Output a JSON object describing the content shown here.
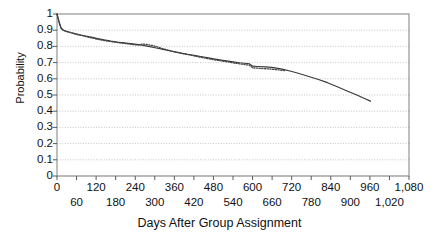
{
  "chart_data": {
    "type": "line",
    "title": "",
    "xlabel": "Days After Group Assignment",
    "ylabel": "Probability",
    "xlim": [
      0,
      1080
    ],
    "ylim": [
      0,
      1
    ],
    "grid": true,
    "legend_position": "none",
    "x_tick_labels": [
      "0",
      "60",
      "120",
      "180",
      "240",
      "300",
      "360",
      "420",
      "480",
      "540",
      "600",
      "660",
      "720",
      "780",
      "840",
      "900",
      "960",
      "1,020",
      "1,080"
    ],
    "x_tick_values": [
      0,
      60,
      120,
      180,
      240,
      300,
      360,
      420,
      480,
      540,
      600,
      660,
      720,
      780,
      840,
      900,
      960,
      1020,
      1080
    ],
    "y_tick_labels": [
      "0",
      "0.1",
      "0.2",
      "0.3",
      "0.4",
      "0.5",
      "0.6",
      "0.7",
      "0.8",
      "0.9",
      "1"
    ],
    "y_tick_values": [
      0,
      0.1,
      0.2,
      0.3,
      0.4,
      0.5,
      0.6,
      0.7,
      0.8,
      0.9,
      1
    ],
    "series": [
      {
        "name": "solid-curve",
        "style": "solid",
        "color": "#3a3a3a",
        "x": [
          0,
          6,
          12,
          20,
          30,
          42,
          55,
          70,
          88,
          105,
          125,
          145,
          165,
          185,
          205,
          225,
          245,
          265,
          285,
          305,
          325,
          345,
          365,
          385,
          405,
          425,
          445,
          465,
          485,
          505,
          525,
          545,
          560,
          575,
          590,
          600,
          615,
          640,
          665,
          690,
          715,
          740,
          770,
          800,
          830,
          860,
          890,
          920,
          945,
          962
        ],
        "y": [
          1.0,
          0.955,
          0.915,
          0.9,
          0.893,
          0.886,
          0.879,
          0.872,
          0.864,
          0.857,
          0.848,
          0.84,
          0.833,
          0.827,
          0.822,
          0.817,
          0.812,
          0.806,
          0.799,
          0.79,
          0.782,
          0.773,
          0.765,
          0.757,
          0.75,
          0.743,
          0.736,
          0.729,
          0.722,
          0.715,
          0.709,
          0.703,
          0.699,
          0.696,
          0.693,
          0.678,
          0.676,
          0.673,
          0.669,
          0.66,
          0.648,
          0.634,
          0.616,
          0.597,
          0.576,
          0.551,
          0.525,
          0.5,
          0.477,
          0.462
        ]
      },
      {
        "name": "dotted-curve",
        "style": "dotted",
        "color": "#444444",
        "x": [
          0,
          6,
          12,
          20,
          32,
          46,
          60,
          78,
          96,
          116,
          138,
          158,
          178,
          198,
          216,
          232,
          248,
          262,
          276,
          292,
          306,
          318,
          330,
          345,
          360,
          378,
          396,
          414,
          432,
          450,
          470,
          490,
          510,
          530,
          548,
          562,
          576,
          590,
          600,
          612,
          626,
          640,
          656,
          672,
          688,
          700
        ],
        "y": [
          1.0,
          0.95,
          0.912,
          0.898,
          0.89,
          0.882,
          0.874,
          0.866,
          0.857,
          0.848,
          0.839,
          0.832,
          0.826,
          0.821,
          0.816,
          0.812,
          0.808,
          0.815,
          0.812,
          0.806,
          0.798,
          0.79,
          0.783,
          0.775,
          0.767,
          0.759,
          0.751,
          0.744,
          0.737,
          0.73,
          0.722,
          0.715,
          0.709,
          0.702,
          0.696,
          0.692,
          0.688,
          0.684,
          0.668,
          0.666,
          0.664,
          0.662,
          0.66,
          0.657,
          0.653,
          0.65
        ]
      }
    ]
  },
  "axes": {
    "ylabel_text": "Probability",
    "xlabel_text": "Days After Group Assignment"
  }
}
